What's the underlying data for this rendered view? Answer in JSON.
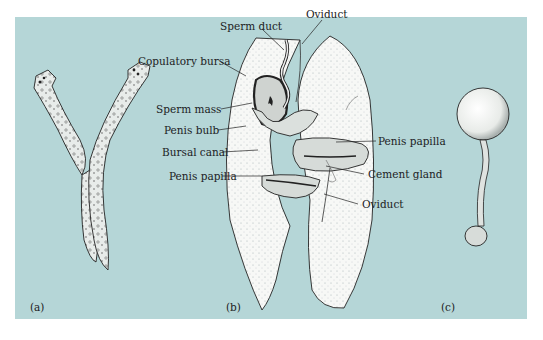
{
  "figure": {
    "background_color": "#b5d6d7",
    "panels": [
      {
        "id": "a",
        "caption": "(a)"
      },
      {
        "id": "b",
        "caption": "(b)"
      },
      {
        "id": "c",
        "caption": "(c)"
      }
    ],
    "labels": {
      "sperm_duct": "Sperm duct",
      "oviduct_top": "Oviduct",
      "copulatory_bursa": "Copulatory bursa",
      "sperm_mass": "Sperm mass",
      "penis_bulb": "Penis bulb",
      "bursal_canal": "Bursal canal",
      "penis_papilla_left": "Penis papilla",
      "penis_papilla_right": "Penis papilla",
      "cement_gland": "Cement gland",
      "oviduct_bottom": "Oviduct"
    }
  }
}
